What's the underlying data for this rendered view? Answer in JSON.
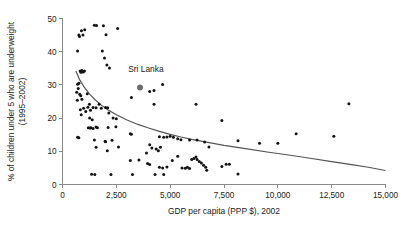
{
  "chart_data": {
    "type": "scatter",
    "title": "",
    "xlabel": "GDP per capita (PPP $), 2002",
    "ylabel": "% of children under 5 who are underweight (1995–2002)",
    "ylabel_line1": "% of children under 5 who are underweight",
    "ylabel_line2": "(1995–2002)",
    "xlim": [
      0,
      15000
    ],
    "ylim": [
      0,
      50
    ],
    "xticks": [
      0,
      2500,
      5000,
      7500,
      10000,
      12500,
      15000
    ],
    "xtick_labels": [
      "0",
      "2,500",
      "5,000",
      "7,500",
      "10,000",
      "12,500",
      "15,000"
    ],
    "yticks": [
      0,
      10,
      20,
      30,
      40,
      50
    ],
    "ytick_labels": [
      "0",
      "10",
      "20",
      "30",
      "40",
      "50"
    ],
    "grid": false,
    "legend": "none",
    "marker_color": "#141414",
    "trend_color": "#555555",
    "annotations": [
      {
        "label": "Sri Lanka",
        "x": 3600,
        "y": 29.2,
        "text_x": 3050,
        "text_y": 33.8,
        "highlight_color": "#6e6e6e"
      }
    ],
    "trend_line": {
      "description": "fitted declining curve",
      "points": [
        [
          620,
          34.2
        ],
        [
          800,
          31.5
        ],
        [
          1000,
          29.4
        ],
        [
          1250,
          27.3
        ],
        [
          1500,
          25.6
        ],
        [
          1800,
          23.9
        ],
        [
          2100,
          22.5
        ],
        [
          2500,
          21.0
        ],
        [
          3000,
          19.4
        ],
        [
          3500,
          18.1
        ],
        [
          4000,
          17.0
        ],
        [
          4500,
          16.0
        ],
        [
          5000,
          15.1
        ],
        [
          5500,
          14.3
        ],
        [
          6000,
          13.6
        ],
        [
          6500,
          13.0
        ],
        [
          7000,
          12.4
        ],
        [
          7500,
          11.8
        ],
        [
          8500,
          10.8
        ],
        [
          9500,
          9.8
        ],
        [
          10500,
          8.9
        ],
        [
          11500,
          7.9
        ],
        [
          12500,
          6.9
        ],
        [
          13500,
          5.9
        ],
        [
          14200,
          5.2
        ],
        [
          15000,
          4.2
        ]
      ]
    },
    "points": [
      [
        760,
        45.0
      ],
      [
        790,
        44.6
      ],
      [
        880,
        46.3
      ],
      [
        950,
        45.0
      ],
      [
        1030,
        46.6
      ],
      [
        1480,
        48.0
      ],
      [
        1580,
        47.9
      ],
      [
        1900,
        47.8
      ],
      [
        2020,
        45.1
      ],
      [
        2560,
        47.0
      ],
      [
        700,
        40.2
      ],
      [
        1850,
        40.2
      ],
      [
        1950,
        38.1
      ],
      [
        2180,
        35.1
      ],
      [
        2060,
        36.0
      ],
      [
        820,
        34.2
      ],
      [
        860,
        33.8
      ],
      [
        900,
        34.3
      ],
      [
        960,
        33.9
      ],
      [
        1020,
        34.2
      ],
      [
        700,
        30.2
      ],
      [
        730,
        28.9
      ],
      [
        760,
        30.5
      ],
      [
        800,
        27.2
      ],
      [
        850,
        26.7
      ],
      [
        660,
        27.8
      ],
      [
        690,
        25.4
      ],
      [
        900,
        25.7
      ],
      [
        1150,
        27.3
      ],
      [
        1250,
        24.2
      ],
      [
        3600,
        29.2
      ],
      [
        3200,
        26.2
      ],
      [
        4050,
        28.0
      ],
      [
        4250,
        28.3
      ],
      [
        4650,
        30.1
      ],
      [
        830,
        22.5
      ],
      [
        870,
        21.0
      ],
      [
        980,
        23.0
      ],
      [
        1080,
        22.0
      ],
      [
        1180,
        23.3
      ],
      [
        1300,
        22.4
      ],
      [
        1420,
        23.2
      ],
      [
        1560,
        23.1
      ],
      [
        1700,
        24.2
      ],
      [
        1800,
        23.0
      ],
      [
        2000,
        23.2
      ],
      [
        2100,
        23.1
      ],
      [
        2150,
        21.5
      ],
      [
        4250,
        24.2
      ],
      [
        6200,
        24.2
      ],
      [
        13300,
        24.3
      ],
      [
        1260,
        20.0
      ],
      [
        1380,
        19.5
      ],
      [
        2350,
        20.0
      ],
      [
        2500,
        19.8
      ],
      [
        1200,
        17.1
      ],
      [
        1280,
        17.0
      ],
      [
        1320,
        17.1
      ],
      [
        1420,
        16.9
      ],
      [
        1560,
        17.3
      ],
      [
        1620,
        17.1
      ],
      [
        2120,
        17.2
      ],
      [
        2480,
        17.4
      ],
      [
        7400,
        19.3
      ],
      [
        3150,
        15.3
      ],
      [
        3200,
        15.1
      ],
      [
        4500,
        14.4
      ],
      [
        4700,
        14.2
      ],
      [
        4850,
        14.3
      ],
      [
        5000,
        14.5
      ],
      [
        5150,
        14.2
      ],
      [
        5350,
        13.8
      ],
      [
        5500,
        13.5
      ],
      [
        5900,
        13.4
      ],
      [
        6250,
        13.4
      ],
      [
        6600,
        12.8
      ],
      [
        6800,
        11.3
      ],
      [
        8150,
        13.2
      ],
      [
        9150,
        12.4
      ],
      [
        10000,
        12.4
      ],
      [
        10850,
        15.3
      ],
      [
        12600,
        14.5
      ],
      [
        700,
        14.2
      ],
      [
        760,
        14.1
      ],
      [
        1480,
        13.4
      ],
      [
        1560,
        11.2
      ],
      [
        1980,
        13.0
      ],
      [
        2000,
        12.9
      ],
      [
        2300,
        13.3
      ],
      [
        2600,
        11.3
      ],
      [
        4050,
        12.0
      ],
      [
        4150,
        11.0
      ],
      [
        4350,
        10.7
      ],
      [
        4450,
        10.2
      ],
      [
        4550,
        11.2
      ],
      [
        2080,
        10.2
      ],
      [
        3900,
        9.5
      ],
      [
        3150,
        7.2
      ],
      [
        3550,
        7.4
      ],
      [
        5100,
        7.2
      ],
      [
        5350,
        8.5
      ],
      [
        5550,
        5.0
      ],
      [
        5700,
        4.9
      ],
      [
        5800,
        5.2
      ],
      [
        5900,
        4.8
      ],
      [
        6000,
        7.5
      ],
      [
        6100,
        7.8
      ],
      [
        6200,
        8.3
      ],
      [
        6250,
        7.5
      ],
      [
        6350,
        6.9
      ],
      [
        6450,
        6.5
      ],
      [
        6550,
        5.8
      ],
      [
        6650,
        5.2
      ],
      [
        6700,
        4.3
      ],
      [
        3950,
        6.3
      ],
      [
        4050,
        6.0
      ],
      [
        4500,
        5.2
      ],
      [
        4650,
        5.0
      ],
      [
        4850,
        5.3
      ],
      [
        7400,
        5.4
      ],
      [
        7600,
        6.1
      ],
      [
        7750,
        6.1
      ],
      [
        1500,
        3.0
      ],
      [
        2250,
        3.0
      ],
      [
        3250,
        3.0
      ],
      [
        4300,
        3.0
      ],
      [
        4700,
        3.0
      ],
      [
        8150,
        3.2
      ],
      [
        1350,
        3.1
      ]
    ]
  }
}
